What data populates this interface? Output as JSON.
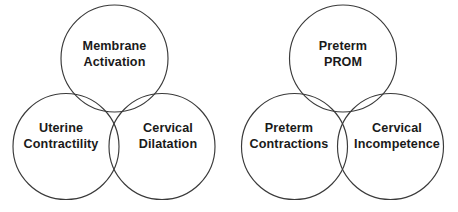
{
  "figure": {
    "type": "venn-diagram-pair",
    "background_color": "#ffffff",
    "stroke_color": "#3a3a3a",
    "text_color": "#1a1a1a"
  },
  "diagrams": [
    {
      "name": "preterm-labor-physiology",
      "circles": [
        {
          "position": "top",
          "label_line1": "Membrane",
          "label_line2": "Activation"
        },
        {
          "position": "bottom-left",
          "label_line1": "Uterine",
          "label_line2": "Contractility"
        },
        {
          "position": "bottom-right",
          "label_line1": "Cervical",
          "label_line2": "Dilatation"
        }
      ]
    },
    {
      "name": "preterm-labor-clinical",
      "circles": [
        {
          "position": "top",
          "label_line1": "Preterm",
          "label_line2": "PROM"
        },
        {
          "position": "bottom-left",
          "label_line1": "Preterm",
          "label_line2": "Contractions"
        },
        {
          "position": "bottom-right",
          "label_line1": "Cervical",
          "label_line2": "Incompetence"
        }
      ]
    }
  ]
}
